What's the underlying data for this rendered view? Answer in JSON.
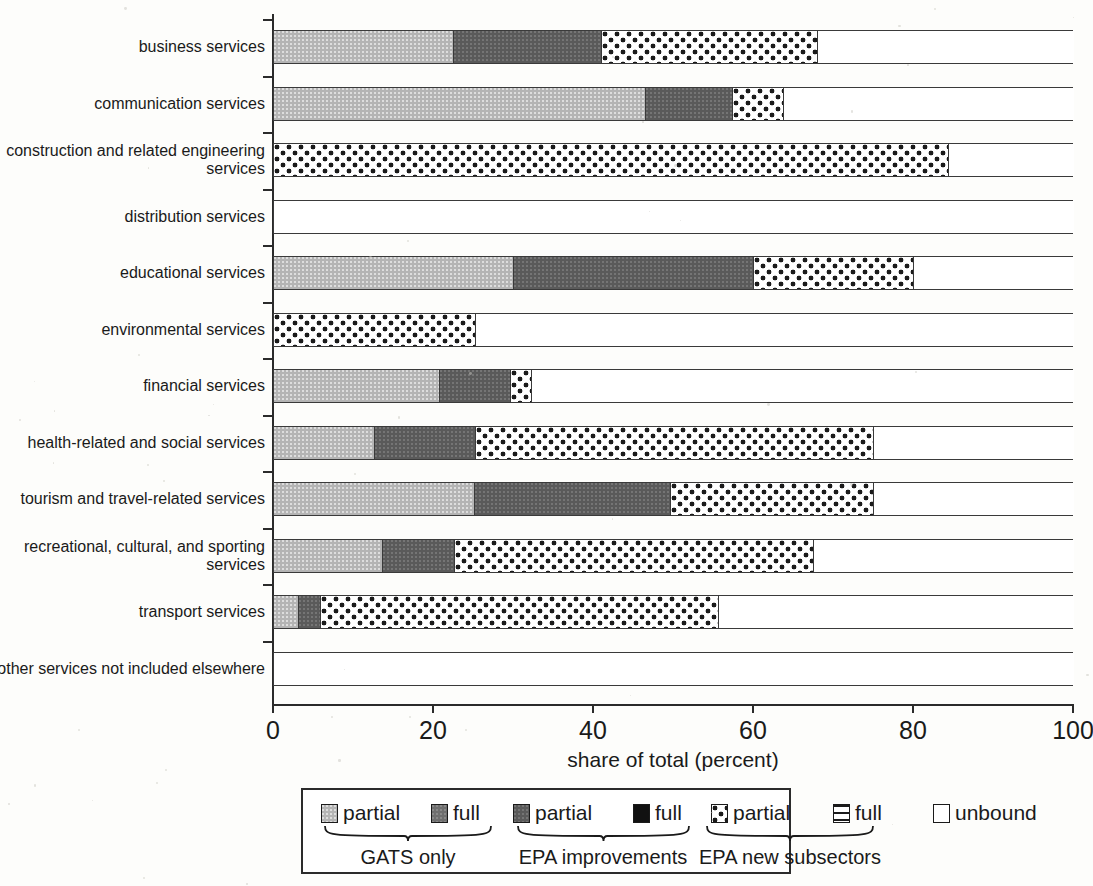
{
  "chart_data": {
    "type": "bar",
    "orientation": "horizontal",
    "stacked": true,
    "title": "",
    "xlabel": "share of total (percent)",
    "ylabel": "",
    "xlim": [
      0,
      100
    ],
    "xticks": [
      0,
      20,
      40,
      60,
      80,
      100
    ],
    "grid": false,
    "legend_position": "bottom",
    "series": [
      {
        "name": "partial",
        "group": "GATS only",
        "key": "gats_partial",
        "fill": "light-gray"
      },
      {
        "name": "full",
        "group": "GATS only",
        "key": "gats_full",
        "fill": "medium-gray"
      },
      {
        "name": "partial",
        "group": "EPA improvements",
        "key": "epa_partial",
        "fill": "dark-gray"
      },
      {
        "name": "full",
        "group": "EPA improvements",
        "key": "epa_full",
        "fill": "black"
      },
      {
        "name": "partial",
        "group": "EPA new subsectors",
        "key": "new_partial",
        "fill": "dotted"
      },
      {
        "name": "full",
        "group": "EPA new subsectors",
        "key": "new_full",
        "fill": "hatched-lines"
      },
      {
        "name": "unbound",
        "group": "",
        "key": "unbound",
        "fill": "white"
      }
    ],
    "categories": [
      "business services",
      "communication services",
      "construction and related engineering services",
      "distribution services",
      "educational services",
      "environmental services",
      "financial services",
      "health-related and social services",
      "tourism and travel-related services",
      "recreational, cultural, and sporting services",
      "transport services",
      "other services not included elsewhere"
    ],
    "values": {
      "gats_partial": [
        22.5,
        46.5,
        0,
        0,
        30.0,
        0,
        20.8,
        12.6,
        25.1,
        13.6,
        3.1,
        0
      ],
      "gats_full": [
        0,
        0,
        0,
        0,
        0,
        0,
        0,
        0,
        0,
        0,
        0,
        0
      ],
      "epa_partial": [
        18.5,
        10.9,
        0,
        0,
        30.0,
        0,
        8.8,
        12.7,
        24.5,
        9.0,
        2.8,
        0
      ],
      "epa_full": [
        0,
        0,
        0,
        0,
        0,
        0,
        0,
        0,
        0,
        0,
        0,
        0
      ],
      "new_partial": [
        27.0,
        6.4,
        84.4,
        0,
        20.0,
        25.2,
        2.7,
        49.7,
        25.4,
        44.9,
        49.7,
        0
      ],
      "new_full": [
        0,
        0,
        0,
        0,
        0,
        0,
        0,
        0,
        0,
        0,
        0,
        0
      ],
      "unbound": [
        32.0,
        36.2,
        15.6,
        100,
        20.0,
        74.8,
        67.7,
        25.0,
        25.0,
        32.5,
        44.4,
        100
      ]
    }
  },
  "rows": [
    {
      "label": "business services",
      "segments": [
        {
          "key": "gats_partial",
          "value": 22.5
        },
        {
          "key": "epa_partial",
          "value": 18.5
        },
        {
          "key": "new_partial",
          "value": 27.0
        },
        {
          "key": "unbound",
          "value": 32.0
        }
      ]
    },
    {
      "label": "communication services",
      "segments": [
        {
          "key": "gats_partial",
          "value": 46.5
        },
        {
          "key": "epa_partial",
          "value": 10.9
        },
        {
          "key": "new_partial",
          "value": 6.4
        },
        {
          "key": "unbound",
          "value": 36.2
        }
      ]
    },
    {
      "label": "construction and related\nengineering services",
      "segments": [
        {
          "key": "new_partial",
          "value": 84.4
        },
        {
          "key": "unbound",
          "value": 15.6
        }
      ]
    },
    {
      "label": "distribution services",
      "segments": [
        {
          "key": "unbound",
          "value": 100
        }
      ]
    },
    {
      "label": "educational services",
      "segments": [
        {
          "key": "gats_partial",
          "value": 30.0
        },
        {
          "key": "epa_partial",
          "value": 30.0
        },
        {
          "key": "new_partial",
          "value": 20.0
        },
        {
          "key": "unbound",
          "value": 20.0
        }
      ]
    },
    {
      "label": "environmental services",
      "segments": [
        {
          "key": "new_partial",
          "value": 25.2
        },
        {
          "key": "unbound",
          "value": 74.8
        }
      ]
    },
    {
      "label": "financial services",
      "segments": [
        {
          "key": "gats_partial",
          "value": 20.8
        },
        {
          "key": "epa_partial",
          "value": 8.8
        },
        {
          "key": "new_partial",
          "value": 2.7
        },
        {
          "key": "unbound",
          "value": 67.7
        }
      ]
    },
    {
      "label": "health-related and social\nservices",
      "segments": [
        {
          "key": "gats_partial",
          "value": 12.6
        },
        {
          "key": "epa_partial",
          "value": 12.7
        },
        {
          "key": "new_partial",
          "value": 49.7
        },
        {
          "key": "unbound",
          "value": 25.0
        }
      ]
    },
    {
      "label": "tourism and travel-related\nservices",
      "segments": [
        {
          "key": "gats_partial",
          "value": 25.1
        },
        {
          "key": "epa_partial",
          "value": 24.5
        },
        {
          "key": "new_partial",
          "value": 25.4
        },
        {
          "key": "unbound",
          "value": 25.0
        }
      ]
    },
    {
      "label": "recreational, cultural, and\nsporting services",
      "segments": [
        {
          "key": "gats_partial",
          "value": 13.6
        },
        {
          "key": "epa_partial",
          "value": 9.0
        },
        {
          "key": "new_partial",
          "value": 44.9
        },
        {
          "key": "unbound",
          "value": 32.5
        }
      ]
    },
    {
      "label": "transport services",
      "segments": [
        {
          "key": "gats_partial",
          "value": 3.1
        },
        {
          "key": "epa_partial",
          "value": 2.8
        },
        {
          "key": "new_partial",
          "value": 49.7
        },
        {
          "key": "unbound",
          "value": 44.4
        }
      ]
    },
    {
      "label": "other services not included\nelsewhere",
      "segments": [
        {
          "key": "unbound",
          "value": 100
        }
      ]
    }
  ],
  "axis": {
    "xlabel": "share of total (percent)",
    "ticks": [
      "0",
      "20",
      "40",
      "60",
      "80",
      "100"
    ]
  },
  "legend": {
    "items": [
      {
        "label": "partial",
        "key": "gats_partial"
      },
      {
        "label": "full",
        "key": "gats_full"
      },
      {
        "label": "partial",
        "key": "epa_partial"
      },
      {
        "label": "full",
        "key": "epa_full"
      },
      {
        "label": "partial",
        "key": "new_partial"
      },
      {
        "label": "full",
        "key": "new_full"
      },
      {
        "label": "unbound",
        "key": "unbound"
      }
    ],
    "groups": [
      {
        "label": "GATS only"
      },
      {
        "label": "EPA improvements"
      },
      {
        "label": "EPA new subsectors"
      }
    ]
  },
  "colors": {
    "gats_partial": "#b4b4b4",
    "gats_full": "#6f6f6f",
    "epa_partial": "#5a5a5a",
    "epa_full": "#111111",
    "new_partial": "#ffffff",
    "new_full": "#ffffff",
    "unbound": "#ffffff",
    "axis": "#2b2b2b",
    "text": "#1a1a1a"
  }
}
